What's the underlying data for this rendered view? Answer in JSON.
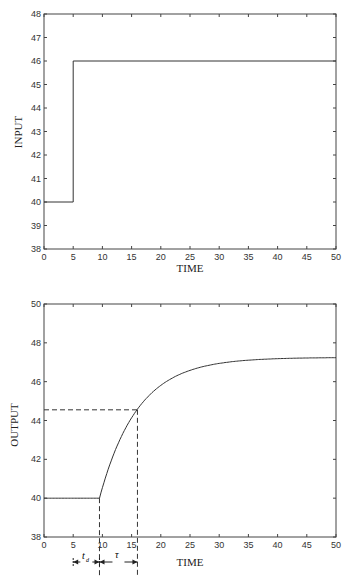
{
  "chart_data": [
    {
      "type": "line",
      "title": "",
      "xlabel": "TIME",
      "ylabel": "INPUT",
      "xlim": [
        0,
        50
      ],
      "ylim": [
        38,
        48
      ],
      "xticks": [
        "0",
        "5",
        "10",
        "15",
        "20",
        "25",
        "30",
        "35",
        "40",
        "45",
        "50"
      ],
      "yticks": [
        "38",
        "39",
        "40",
        "41",
        "42",
        "43",
        "44",
        "45",
        "46",
        "47",
        "48"
      ],
      "grid": false,
      "series": [
        {
          "name": "input step",
          "x": [
            0,
            5,
            5,
            50
          ],
          "y": [
            40,
            40,
            46,
            46
          ]
        }
      ]
    },
    {
      "type": "line",
      "title": "",
      "xlabel": "TIME",
      "ylabel": "OUTPUT",
      "xlim": [
        0,
        50
      ],
      "ylim": [
        38,
        50
      ],
      "xticks": [
        "0",
        "5",
        "10",
        "15",
        "20",
        "25",
        "30",
        "35",
        "40",
        "45",
        "50"
      ],
      "yticks": [
        "38",
        "40",
        "42",
        "44",
        "46",
        "48",
        "50"
      ],
      "grid": false,
      "series": [
        {
          "name": "output response",
          "x": [
            0,
            9.5,
            11,
            13,
            15,
            16,
            18,
            20,
            22,
            25,
            28,
            30,
            35,
            40,
            45,
            50
          ],
          "y": [
            40,
            40,
            40.7,
            42.4,
            43.7,
            44.55,
            45.3,
            45.9,
            46.35,
            46.75,
            46.95,
            47.03,
            47.13,
            47.18,
            47.2,
            47.22
          ]
        }
      ],
      "annotations": [
        {
          "type": "dashed-hline",
          "y": 44.55,
          "x_from": 0,
          "x_to": 16
        },
        {
          "type": "dashed-vline",
          "x": 9.5,
          "y_from": 40
        },
        {
          "type": "dashed-vline",
          "x": 16,
          "y_from": 44.55
        },
        {
          "type": "interval",
          "label": "t_d",
          "x_from": 5,
          "x_to": 9.5
        },
        {
          "type": "interval",
          "label": "τ",
          "x_from": 9.5,
          "x_to": 16
        }
      ]
    }
  ],
  "labels": {
    "plot1_ylabel": "INPUT",
    "plot1_xlabel": "TIME",
    "plot2_ylabel": "OUTPUT",
    "plot2_xlabel": "TIME",
    "td_label": "t",
    "td_sub": "d",
    "tau_label": "τ"
  }
}
